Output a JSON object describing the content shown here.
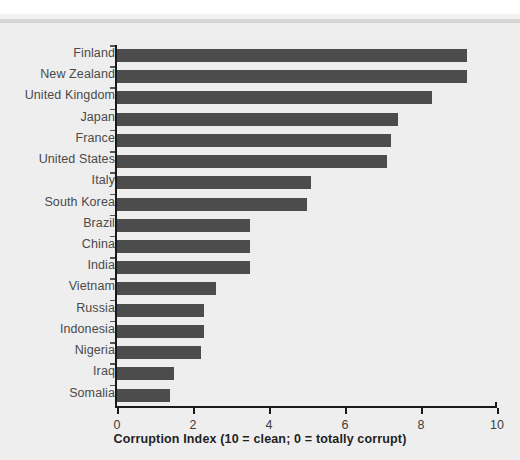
{
  "chart_data": {
    "type": "bar",
    "orientation": "horizontal",
    "title": "",
    "xlabel": "Corruption Index (10 = clean; 0 = totally corrupt)",
    "ylabel": "",
    "xlim": [
      0,
      10
    ],
    "xticks": [
      0,
      2,
      4,
      6,
      8,
      10
    ],
    "xtick_labels": [
      "0",
      "2",
      "4",
      "6",
      "8",
      "10"
    ],
    "grid": false,
    "legend": null,
    "bar_color": "#4c4c4c",
    "background_color": "#eeeeee",
    "axis_color": "#1a1a1a",
    "categories": [
      "Finland",
      "New Zealand",
      "United Kingdom",
      "Japan",
      "France",
      "United States",
      "Italy",
      "South Korea",
      "Brazil",
      "China",
      "India",
      "Vietnam",
      "Russia",
      "Indonesia",
      "Nigeria",
      "Iraq",
      "Somalia"
    ],
    "values": [
      9.2,
      9.2,
      8.3,
      7.4,
      7.2,
      7.1,
      5.1,
      5.0,
      3.5,
      3.5,
      3.5,
      2.6,
      2.3,
      2.3,
      2.2,
      1.5,
      1.4
    ]
  }
}
